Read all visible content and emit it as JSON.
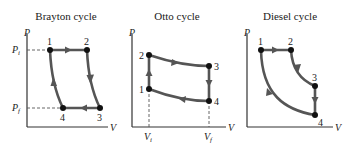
{
  "diagrams": [
    {
      "title": "Brayton cycle",
      "axes": {
        "y": "P",
        "x": "V"
      },
      "y_ticks": [
        {
          "label": "P",
          "sub": "i"
        },
        {
          "label": "P",
          "sub": "f"
        }
      ],
      "points": [
        "1",
        "2",
        "3",
        "4"
      ]
    },
    {
      "title": "Otto cycle",
      "axes": {
        "y": "P",
        "x": "V"
      },
      "x_ticks": [
        {
          "label": "V",
          "sub": "i"
        },
        {
          "label": "V",
          "sub": "f"
        }
      ],
      "points": [
        "1",
        "2",
        "3",
        "4"
      ]
    },
    {
      "title": "Diesel cycle",
      "axes": {
        "y": "P",
        "x": "V"
      },
      "points": [
        "1",
        "2",
        "3",
        "4"
      ]
    }
  ],
  "colors": {
    "path": "#555555",
    "axis": "#333333",
    "point": "#111111"
  }
}
